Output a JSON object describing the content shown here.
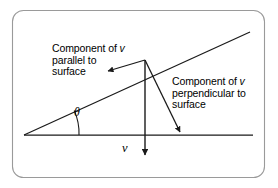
{
  "figure": {
    "border_color": "#9a9a9a",
    "line_color": "#1a1a1a",
    "background": "#ffffff",
    "labels": {
      "parallel": {
        "line1_pre": "Component of ",
        "line1_var": "v",
        "line2": "parallel to",
        "line3": "surface"
      },
      "perpendicular": {
        "line1_pre": "Component of ",
        "line1_var": "v",
        "line2": "perpendicular to",
        "line3": "surface"
      },
      "angle_symbol": "θ",
      "velocity_symbol": "v"
    },
    "geometry": {
      "surface_line": {
        "x1": 24,
        "y1": 135,
        "x2": 253,
        "y2": 135
      },
      "incline_line": {
        "x1": 24,
        "y1": 135,
        "x2": 250,
        "y2": 32
      },
      "vertex": {
        "x": 145,
        "y": 60
      },
      "velocity_arrow": {
        "x1": 145,
        "y1": 60,
        "x2": 145,
        "y2": 158
      },
      "parallel_arrow": {
        "x1": 145,
        "y1": 60,
        "x2": 105,
        "y2": 72
      },
      "perpendicular_arrow": {
        "x1": 145,
        "y1": 60,
        "x2": 182,
        "y2": 136
      },
      "angle_degrees": 24.5
    }
  }
}
